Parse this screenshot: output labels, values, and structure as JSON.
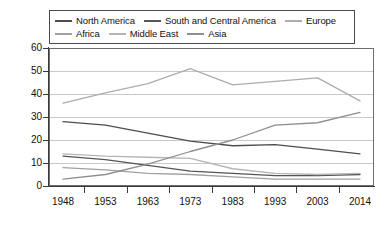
{
  "chart_data": {
    "type": "line",
    "title": "",
    "subtitle": "",
    "xlabel": "",
    "ylabel": "",
    "x": [
      1948,
      1953,
      1963,
      1973,
      1983,
      1993,
      2003,
      2014
    ],
    "x_tick_labels": [
      "1948",
      "1953",
      "1963",
      "1973",
      "1983",
      "1993",
      "2003",
      "2014"
    ],
    "y_tick_labels": [
      "60",
      "50",
      "40",
      "30",
      "20",
      "10",
      "0"
    ],
    "y_ticks": [
      60,
      50,
      40,
      30,
      20,
      10,
      0
    ],
    "ylim": [
      0,
      60
    ],
    "grid": "horizontal",
    "legend_position": "top",
    "series": [
      {
        "name": "North America",
        "color": "#4d4d4d",
        "values": [
          28,
          26.5,
          23,
          19.5,
          17.5,
          18,
          16,
          14
        ]
      },
      {
        "name": "South and Central America",
        "color": "#555555",
        "values": [
          13,
          11.5,
          9,
          6.5,
          5.5,
          4.5,
          4.5,
          5
        ]
      },
      {
        "name": "Europe",
        "color": "#adadad",
        "values": [
          36,
          40.5,
          44.5,
          51,
          44,
          45.5,
          47,
          37
        ]
      },
      {
        "name": "Africa",
        "color": "#a0a0a0",
        "values": [
          8,
          7,
          5.5,
          5,
          4,
          3,
          3,
          3
        ]
      },
      {
        "name": "Middle East",
        "color": "#b5b5b5",
        "values": [
          14,
          13,
          12.5,
          12,
          7.5,
          5.5,
          5,
          5.5
        ]
      },
      {
        "name": "Asia",
        "color": "#8f8f8f",
        "values": [
          3,
          5,
          9.5,
          15,
          20,
          26.5,
          27.5,
          32
        ]
      }
    ]
  },
  "legend": {
    "rows": [
      [
        {
          "label": "North America",
          "color": "#4d4d4d"
        },
        {
          "label": "South and Central America",
          "color": "#555555"
        },
        {
          "label": "Europe",
          "color": "#adadad"
        }
      ],
      [
        {
          "label": "Africa",
          "color": "#a0a0a0"
        },
        {
          "label": "Middle East",
          "color": "#b5b5b5"
        },
        {
          "label": "Asia",
          "color": "#8f8f8f"
        }
      ]
    ]
  }
}
